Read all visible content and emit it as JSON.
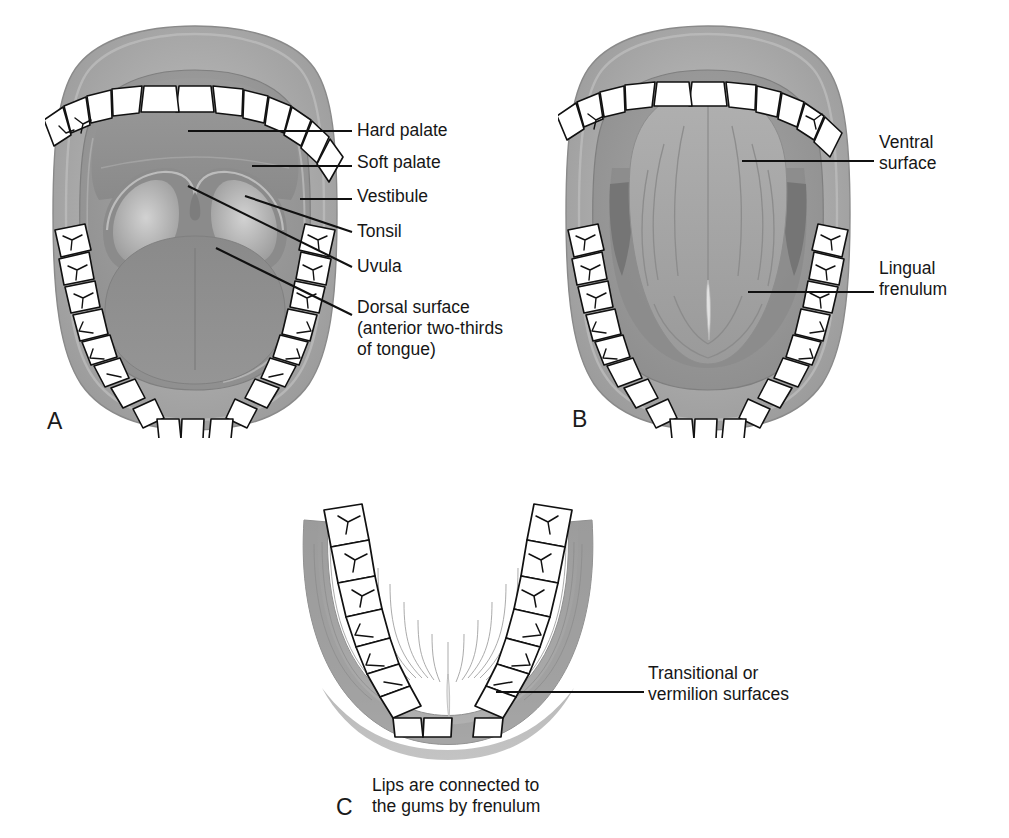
{
  "figure": {
    "kind": "anatomy-diagram",
    "panels": [
      {
        "id": "A",
        "letter": "A",
        "view": "Open mouth, anterior view of dorsal tongue and palate"
      },
      {
        "id": "B",
        "letter": "B",
        "view": "Tongue elevated, ventral surface view"
      },
      {
        "id": "C",
        "letter": "C",
        "view": "Mandibular arch, lower lip reflected"
      }
    ]
  },
  "panel_letters": {
    "a": "A",
    "b": "B",
    "c": "C"
  },
  "labels": {
    "hard_palate": "Hard palate",
    "soft_palate": "Soft palate",
    "vestibule": "Vestibule",
    "tonsil": "Tonsil",
    "uvula": "Uvula",
    "dorsal_surface": "Dorsal surface\n(anterior two-thirds\nof tongue)",
    "ventral_surface": "Ventral\nsurface",
    "lingual_frenulum": "Lingual\nfrenulum",
    "vermilion": "Transitional or\nvermilion surfaces"
  },
  "captions": {
    "panel_c": "Lips are connected to\nthe gums by frenulum"
  },
  "colors": {
    "background": "#ffffff",
    "text": "#161616",
    "leader_line": "#111111",
    "lip_outer": "#a9a9a9",
    "lip_highlight": "#c6c6c6",
    "oral_mucosa": "#9e9e9e",
    "palate": "#8f8f8f",
    "tongue_dorsal": "#8d8d8d",
    "tongue_ventral": "#a3a3a3",
    "tonsil_light": "#c9c9c9",
    "tooth_fill": "#ffffff",
    "tooth_outline": "#101010",
    "gum": "#9b9b9b"
  }
}
